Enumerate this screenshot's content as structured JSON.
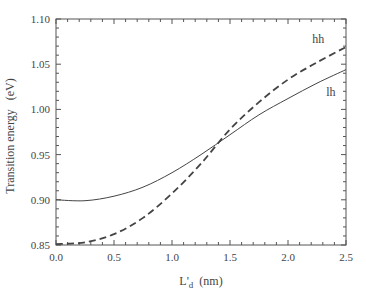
{
  "chart_data": {
    "type": "line",
    "title": "",
    "xlabel": "L'd (nm)",
    "xlabel_main": "L'",
    "xlabel_sub": "d",
    "xlabel_unit": "(nm)",
    "ylabel": "Transition energy   (eV)",
    "xlim": [
      0.0,
      2.5
    ],
    "ylim": [
      0.85,
      1.1
    ],
    "x_ticks": [
      "0.0",
      "0.5",
      "1.0",
      "1.5",
      "2.0",
      "2.5"
    ],
    "y_ticks": [
      "0.85",
      "0.90",
      "0.95",
      "1.00",
      "1.05",
      "1.10"
    ],
    "grid": false,
    "legend": "inline labels at right",
    "x": [
      0.0,
      0.25,
      0.5,
      0.75,
      1.0,
      1.25,
      1.5,
      1.75,
      2.0,
      2.25,
      2.5
    ],
    "series": [
      {
        "name": "hh",
        "style": "dashed",
        "values": [
          0.851,
          0.853,
          0.862,
          0.88,
          0.907,
          0.94,
          0.978,
          1.008,
          1.033,
          1.052,
          1.069
        ]
      },
      {
        "name": "lh",
        "style": "solid",
        "values": [
          0.9,
          0.899,
          0.904,
          0.914,
          0.93,
          0.95,
          0.972,
          0.994,
          1.012,
          1.029,
          1.044
        ]
      }
    ],
    "annotations": [
      {
        "text": "hh",
        "x": 2.21,
        "y": 1.073
      },
      {
        "text": "lh",
        "x": 2.33,
        "y": 1.015
      }
    ]
  }
}
